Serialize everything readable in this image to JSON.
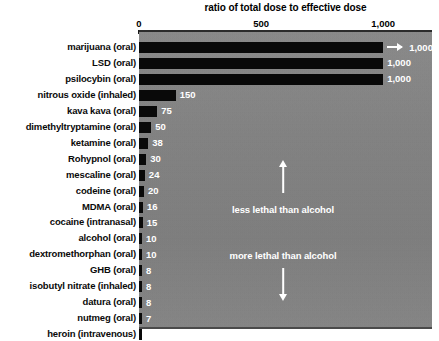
{
  "chart_data": {
    "type": "bar",
    "title": "ratio of total dose to effective dose",
    "xlabel": "",
    "ylabel": "",
    "orientation": "horizontal",
    "xlim": [
      0,
      1200
    ],
    "grid": false,
    "legend": "none",
    "axis_ticks": [
      {
        "label": "0",
        "value": 0
      },
      {
        "label": "500",
        "value": 500
      },
      {
        "label": "1,000",
        "value": 1000
      }
    ],
    "categories": [
      "marijuana (oral)",
      "LSD (oral)",
      "psilocybin (oral)",
      "nitrous oxide (inhaled)",
      "kava kava (oral)",
      "dimethyltryptamine (oral)",
      "ketamine (oral)",
      "Rohypnol (oral)",
      "mescaline (oral)",
      "codeine (oral)",
      "MDMA (oral)",
      "cocaine (intranasal)",
      "alcohol (oral)",
      "dextromethorphan (oral)",
      "GHB (oral)",
      "isobutyl nitrate (inhaled)",
      "datura (oral)",
      "nutmeg (oral)",
      "heroin (intravenous)"
    ],
    "values": [
      1000,
      1000,
      1000,
      150,
      75,
      50,
      38,
      30,
      24,
      20,
      16,
      15,
      10,
      10,
      8,
      8,
      8,
      7,
      5
    ],
    "value_labels": [
      "1,000",
      "1,000",
      "1,000",
      "150",
      "75",
      "50",
      "38",
      "30",
      "24",
      "20",
      "16",
      "15",
      "10",
      "10",
      "8",
      "8",
      "8",
      "7",
      "5"
    ],
    "bars": [
      {
        "label": "marijuana (oral)",
        "value": 1000,
        "value_label": "1,000",
        "overflow": true
      },
      {
        "label": "LSD (oral)",
        "value": 1000,
        "value_label": "1,000",
        "overflow": false
      },
      {
        "label": "psilocybin (oral)",
        "value": 1000,
        "value_label": "1,000",
        "overflow": false
      },
      {
        "label": "nitrous oxide (inhaled)",
        "value": 150,
        "value_label": "150",
        "overflow": false
      },
      {
        "label": "kava kava (oral)",
        "value": 75,
        "value_label": "75",
        "overflow": false
      },
      {
        "label": "dimethyltryptamine (oral)",
        "value": 50,
        "value_label": "50",
        "overflow": false
      },
      {
        "label": "ketamine (oral)",
        "value": 38,
        "value_label": "38",
        "overflow": false
      },
      {
        "label": "Rohypnol (oral)",
        "value": 30,
        "value_label": "30",
        "overflow": false
      },
      {
        "label": "mescaline (oral)",
        "value": 24,
        "value_label": "24",
        "overflow": false
      },
      {
        "label": "codeine (oral)",
        "value": 20,
        "value_label": "20",
        "overflow": false
      },
      {
        "label": "MDMA (oral)",
        "value": 16,
        "value_label": "16",
        "overflow": false
      },
      {
        "label": "cocaine (intranasal)",
        "value": 15,
        "value_label": "15",
        "overflow": false
      },
      {
        "label": "alcohol (oral)",
        "value": 10,
        "value_label": "10",
        "overflow": false
      },
      {
        "label": "dextromethorphan (oral)",
        "value": 10,
        "value_label": "10",
        "overflow": false
      },
      {
        "label": "GHB (oral)",
        "value": 8,
        "value_label": "8",
        "overflow": false
      },
      {
        "label": "isobutyl nitrate (inhaled)",
        "value": 8,
        "value_label": "8",
        "overflow": false
      },
      {
        "label": "datura (oral)",
        "value": 8,
        "value_label": "8",
        "overflow": false
      },
      {
        "label": "nutmeg (oral)",
        "value": 7,
        "value_label": "7",
        "overflow": false
      },
      {
        "label": "heroin (intravenous)",
        "value": 5,
        "value_label": "5",
        "overflow": false
      }
    ],
    "annotations": [
      {
        "text": "less lethal than alcohol",
        "arrow": "up"
      },
      {
        "text": "more lethal than alcohol",
        "arrow": "down"
      }
    ],
    "colors": {
      "bar": "#090909",
      "plot_background": "#828282",
      "value_text": "#ffffff",
      "label_text": "#0a0a0a",
      "annotation_text": "#ffffff",
      "axis": "#2b2b2b"
    }
  }
}
